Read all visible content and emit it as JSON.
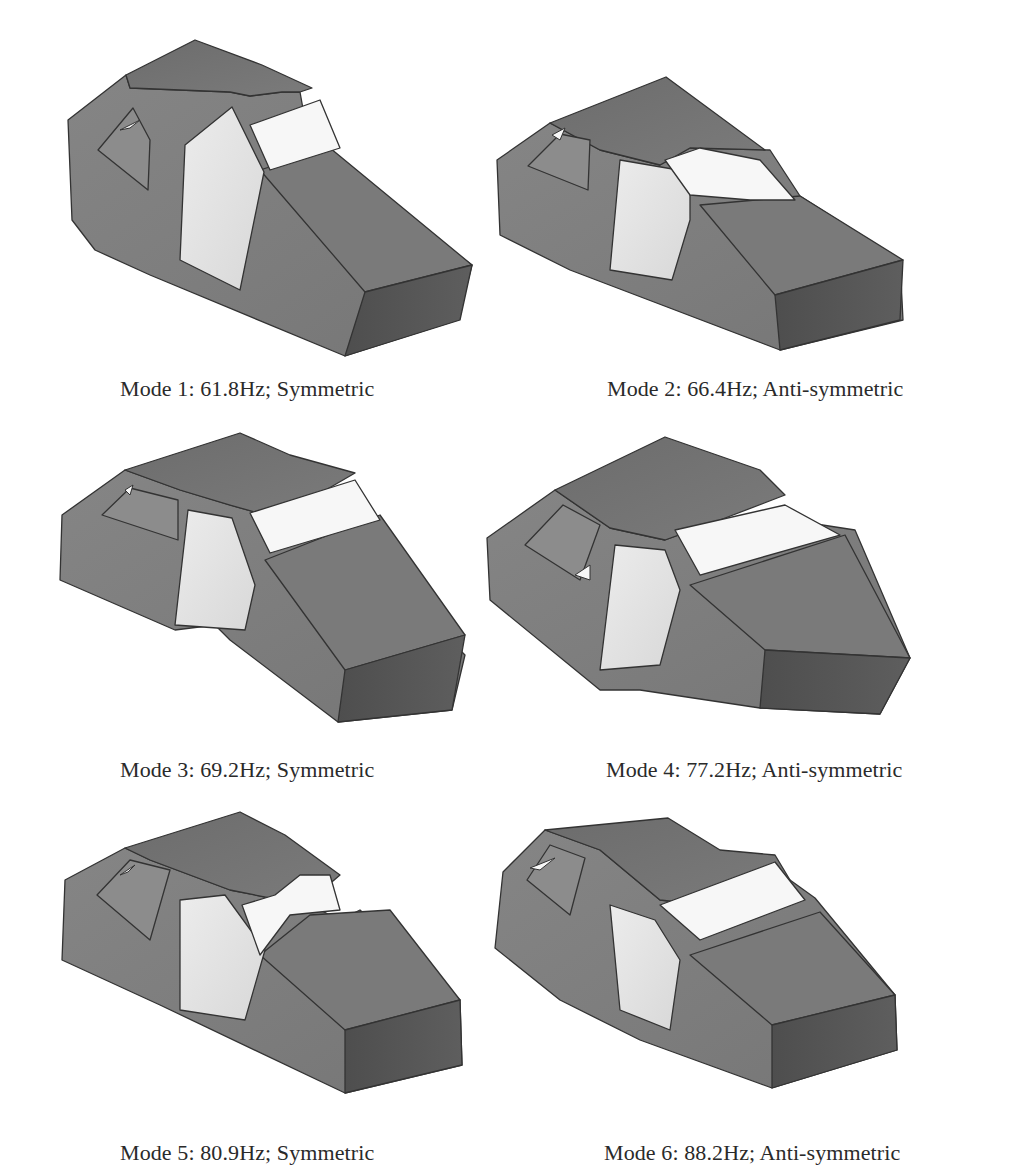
{
  "figure": {
    "colors": {
      "side": "#7f7f7f",
      "roof": "#727272",
      "hood": "#7a7a7a",
      "front": "#555555",
      "frame": "#8a8a8a",
      "glass": "#e6e6e6",
      "glass_bright": "#f7f7f7",
      "rear_glass": "#8c8c8c",
      "edge": "#333333"
    },
    "panels": [
      {
        "caption": "Mode 1: 61.8Hz; Symmetric",
        "mode": 1,
        "frequency_hz": 61.8,
        "symmetry": "Symmetric",
        "caption_pos": [
          120,
          376
        ],
        "side": "68,120 126,75 130,88 230,92 250,96 282,92 300,92 310,148 330,160 472,265 458,320 345,356 150,275 95,250 72,220",
        "roof": "126,75 195,40 262,65 312,88 300,92 282,92 250,96 230,92 130,88",
        "hood": "260,170 330,148 472,265 365,292",
        "front": "365,292 472,265 460,320 345,356",
        "rear_window": "98,150 133,108 150,140 148,190",
        "door_glass": "185,145 232,107 264,172 240,290 180,260",
        "windshield": "250,125 320,100 340,148 270,170",
        "rear_tri": "120,130 140,120 130,128"
      },
      {
        "caption": "Mode 2: 66.4Hz; Anti-symmetric",
        "mode": 2,
        "frequency_hz": 66.4,
        "symmetry": "Anti-symmetric",
        "caption_pos": [
          607,
          376
        ],
        "side": "497,160 550,123 600,150 660,165 690,148 770,150 800,196 900,260 903,320 780,350 570,270 500,235",
        "roof": "550,123 666,77 765,150 690,148 660,165 600,150",
        "hood": "700,205 800,196 903,260 775,295",
        "front": "775,295 903,260 900,320 780,350",
        "rear_window": "528,166 560,134 590,140 588,190",
        "door_glass": "620,160 690,172 690,220 672,280 610,270",
        "windshield": "665,160 700,148 760,160 795,200 750,200 690,195",
        "rear_tri": "552,135 565,128 560,140"
      },
      {
        "caption": "Mode 3: 69.2Hz; Symmetric",
        "mode": 3,
        "frequency_hz": 69.2,
        "symmetry": "Anti-symmetric",
        "caption_pos": [
          120,
          757
        ],
        "side": "62,515 125,470 180,490 230,505 265,515 300,505 330,540 355,545 465,655 452,710 338,722 230,640 215,625 175,630 60,580",
        "roof": "125,470 240,433 290,455 355,473 300,505 265,515 230,505 180,490",
        "hood": "265,560 380,515 465,635 345,670",
        "front": "345,670 465,635 452,710 338,722",
        "rear_window": "102,515 130,488 178,500 178,540",
        "door_glass": "188,510 232,518 255,585 245,630 175,625",
        "windshield": "250,513 355,480 380,520 270,553",
        "rear_tri": "125,490 133,485 130,495"
      },
      {
        "caption": "Mode 4: 77.2Hz; Anti-symmetric",
        "mode": 4,
        "frequency_hz": 77.2,
        "symmetry": "Anti-symmetric",
        "caption_pos": [
          606,
          757
        ],
        "side": "487,538 555,490 610,528 665,540 720,520 790,520 855,530 910,658 880,714 760,708 640,690 600,690 490,600",
        "roof": "555,490 665,437 760,470 785,495 720,520 665,540 610,528",
        "hood": "690,585 845,535 910,658 765,650",
        "front": "765,650 910,658 880,714 760,708",
        "rear_window": "525,545 563,505 600,525 580,580",
        "door_glass": "615,545 665,550 680,590 660,665 600,670",
        "windshield": "675,530 785,505 840,535 700,575",
        "rear_tri": "575,575 590,565 590,580"
      },
      {
        "caption": "Mode 5: 80.9Hz; Symmetric",
        "mode": 5,
        "frequency_hz": 80.9,
        "symmetry": "Symmetric",
        "caption_pos": [
          120,
          1140
        ],
        "side": "65,880 125,848 150,860 230,890 280,900 310,905 340,920 360,910 460,1000 462,1065 345,1093 160,1005 62,960",
        "roof": "125,848 240,812 285,835 340,875 305,905 280,900 230,890 150,860",
        "hood": "260,955 310,915 390,910 460,1000 345,1030",
        "front": "345,1030 460,1000 462,1065 345,1093",
        "rear_window": "97,895 130,860 170,870 150,940",
        "door_glass": "180,900 225,895 265,950 245,1020 180,1010",
        "windshield": "242,905 275,895 300,875 330,875 340,910 290,915 260,955",
        "rear_tri": "120,875 135,865 128,872"
      },
      {
        "caption": "Mode 6: 88.2Hz; Anti-symmetric",
        "mode": 6,
        "frequency_hz": 88.2,
        "symmetry": "Anti-symmetric",
        "caption_pos": [
          604,
          1140
        ],
        "side": "503,872 545,830 600,850 660,900 705,905 790,880 815,898 895,995 897,1050 772,1088 640,1040 560,1000 495,948",
        "roof": "545,830 668,818 720,850 775,855 790,880 705,905 660,900 600,850",
        "hood": "690,955 820,912 895,995 772,1025",
        "front": "772,1025 895,995 897,1050 772,1088",
        "rear_window": "527,880 550,845 585,858 570,915",
        "door_glass": "610,905 655,920 680,960 670,1030 620,1010",
        "windshield": "660,905 775,862 805,900 700,940",
        "rear_tri": "530,868 555,858 540,870"
      }
    ]
  }
}
